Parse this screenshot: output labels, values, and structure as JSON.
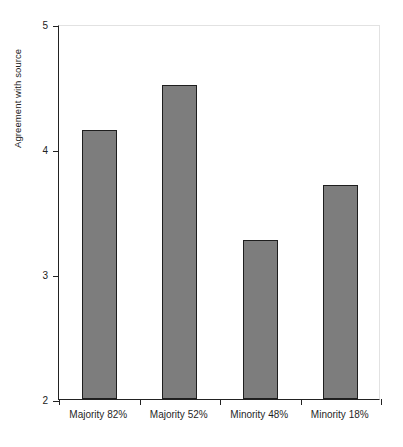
{
  "chart_data": {
    "type": "bar",
    "title": "",
    "xlabel": "",
    "ylabel": "Agreement with source",
    "categories": [
      "Majority 82%",
      "Majority 52%",
      "Minority 48%",
      "Minority 18%"
    ],
    "values": [
      4.15,
      4.51,
      3.27,
      3.71
    ],
    "ylim": [
      2,
      5
    ],
    "yticks": [
      2,
      3,
      4,
      5
    ],
    "ytick_labels": [
      "2",
      "3",
      "4",
      "5"
    ],
    "grid": false,
    "legend": false,
    "series": [
      {
        "name": "Agreement with source",
        "values": [
          4.15,
          4.51,
          3.27,
          3.71
        ]
      }
    ],
    "colors": {
      "bar_fill": "#7d7d7d",
      "bar_edge": "#1e1e1e",
      "axis": "#222222",
      "background": "#ffffff"
    }
  }
}
